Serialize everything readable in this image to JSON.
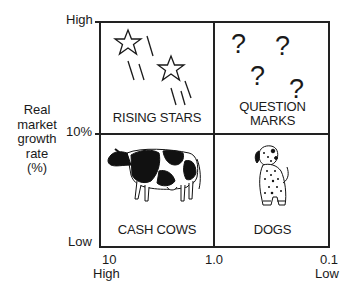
{
  "diagram": {
    "type": "growth-share-matrix",
    "y_axis": {
      "label": "Real market growth rate (%)",
      "label_lines": [
        "Real",
        "market",
        "growth",
        "rate",
        "(%)"
      ],
      "ticks": {
        "top": "High",
        "middle": "10%",
        "bottom": "Low"
      }
    },
    "x_axis": {
      "ticks": {
        "left": "10",
        "middle": "1.0",
        "right": "0.1"
      },
      "ends": {
        "left": "High",
        "right": "Low"
      }
    },
    "quadrants": [
      {
        "id": "top-left",
        "label": "RISING STARS",
        "icon": "star-icon"
      },
      {
        "id": "top-right",
        "label_lines": [
          "QUESTION",
          "MARKS"
        ],
        "icon": "question-mark-icon"
      },
      {
        "id": "bottom-left",
        "label": "CASH COWS",
        "icon": "cow-icon"
      },
      {
        "id": "bottom-right",
        "label": "DOGS",
        "icon": "dog-icon"
      }
    ],
    "colors": {
      "line": "#222222",
      "background": "#ffffff"
    }
  }
}
